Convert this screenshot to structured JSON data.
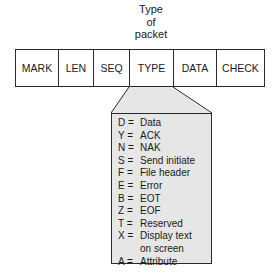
{
  "title_lines": [
    "Type",
    "of",
    "packet"
  ],
  "packet_fields": [
    {
      "label": "MARK",
      "width": 43
    },
    {
      "label": "LEN",
      "width": 35
    },
    {
      "label": "SEQ",
      "width": 36
    },
    {
      "label": "TYPE",
      "width": 44
    },
    {
      "label": "DATA",
      "width": 43
    },
    {
      "label": "CHECK",
      "width": 49
    }
  ],
  "legend": [
    {
      "key": "D =",
      "desc": "Data"
    },
    {
      "key": "Y =",
      "desc": "ACK"
    },
    {
      "key": "N =",
      "desc": "NAK"
    },
    {
      "key": "S =",
      "desc": "Send initiate"
    },
    {
      "key": "F =",
      "desc": "File header"
    },
    {
      "key": "E =",
      "desc": "Error"
    },
    {
      "key": "B =",
      "desc": "EOT"
    },
    {
      "key": "Z =",
      "desc": "EOF"
    },
    {
      "key": "T =",
      "desc": "Reserved"
    },
    {
      "key": "X =",
      "desc": "Display text"
    },
    {
      "key": "",
      "desc": "on screen"
    },
    {
      "key": "A =",
      "desc": "Attribute"
    }
  ],
  "colors": {
    "line": "#2a2a2a",
    "legend_fill": "#e6e6e6"
  }
}
